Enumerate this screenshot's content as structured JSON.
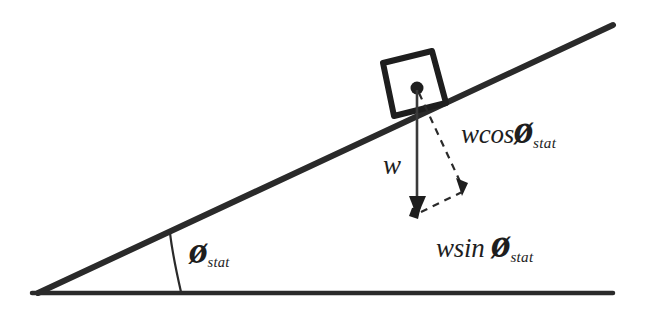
{
  "diagram": {
    "type": "free-body-diagram",
    "background_color": "#ffffff",
    "stroke_color": "#2a2a2a",
    "labels": {
      "weight": "w",
      "normal_component_fn": "wcos",
      "parallel_component_fn": "wsin",
      "phi_symbol": "ø",
      "subscript": "stat",
      "angle_symbol": "ø",
      "angle_subscript": "stat"
    },
    "elements": {
      "incline_surface": "incline-surface-line",
      "ground_line": "ground-baseline",
      "block": "block-on-incline",
      "center_of_mass_dot": "center-of-mass-dot",
      "weight_vector": "weight-vector-arrow",
      "normal_component_vector": "normal-component-dashed-arrow",
      "parallel_component_vector": "parallel-component-dashed-construction",
      "angle_arc": "incline-angle-arc"
    },
    "geometry": {
      "apex": [
        38,
        293
      ],
      "incline_end": [
        613,
        25
      ],
      "ground_end": [
        613,
        293
      ],
      "incline_angle_deg": 25,
      "block_corners": [
        [
          383,
          63
        ],
        [
          432,
          51
        ],
        [
          446,
          103
        ],
        [
          394,
          116
        ]
      ],
      "com_dot": [
        417,
        88
      ],
      "weight_tip": [
        417,
        214
      ],
      "component_corner": [
        464,
        192
      ]
    }
  }
}
